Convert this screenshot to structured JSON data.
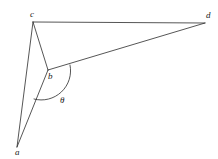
{
  "figure": {
    "type": "geometry-diagram",
    "background_color": "#ffffff",
    "stroke_color": "#2b2b2b",
    "stroke_width": 0.8,
    "vertices": [
      {
        "id": "a",
        "label": "a",
        "x": 17,
        "y": 147,
        "label_x": 15,
        "label_y": 148
      },
      {
        "id": "b",
        "label": "b",
        "x": 48,
        "y": 70,
        "label_x": 48,
        "label_y": 72
      },
      {
        "id": "c",
        "label": "c",
        "x": 33,
        "y": 22,
        "label_x": 30,
        "label_y": 10
      },
      {
        "id": "d",
        "label": "d",
        "x": 205,
        "y": 23,
        "label_x": 206,
        "label_y": 11
      }
    ],
    "edges": [
      {
        "id": "cd",
        "from": "c",
        "to": "d"
      },
      {
        "id": "ca",
        "from": "c",
        "to": "a"
      },
      {
        "id": "cb",
        "from": "c",
        "to": "b"
      },
      {
        "id": "bd",
        "from": "b",
        "to": "d"
      },
      {
        "id": "ba",
        "from": "b",
        "to": "a"
      }
    ],
    "angle": {
      "id": "theta",
      "symbol": "θ",
      "at_vertex": "b",
      "between_rays": [
        "bd",
        "ba"
      ],
      "arc_radius": 29,
      "arc_start_x": 70,
      "arc_start_y": 65,
      "arc_end_x": 34,
      "arc_end_y": 99,
      "label_x": 60,
      "label_y": 96
    }
  }
}
